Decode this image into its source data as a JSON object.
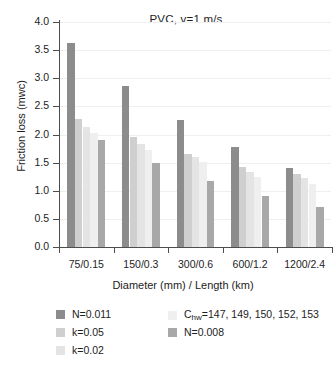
{
  "chart_data": {
    "type": "bar",
    "title": "PVC, v=1 m/s",
    "xlabel": "Diameter (mm) / Length (km)",
    "ylabel": "Friction loss (mwc)",
    "categories": [
      "75/0.15",
      "150/0.3",
      "300/0.6",
      "600/1.2",
      "1200/2.4"
    ],
    "ylim": [
      0.0,
      4.0
    ],
    "yticks": [
      "0.0",
      "0.5",
      "1.0",
      "1.5",
      "2.0",
      "2.5",
      "3.0",
      "3.5",
      "4.0"
    ],
    "grid": true,
    "legend_position": "bottom",
    "series": [
      {
        "name": "N=0.011",
        "color": "#8c8c8c",
        "values": [
          3.63,
          2.87,
          2.26,
          1.78,
          1.4
        ]
      },
      {
        "name": "k=0.05",
        "color": "#cfcfcf",
        "values": [
          2.28,
          1.95,
          1.66,
          1.42,
          1.3
        ]
      },
      {
        "name": "k=0.02",
        "color": "#e4e4e4",
        "values": [
          2.13,
          1.83,
          1.6,
          1.33,
          1.22
        ]
      },
      {
        "name": "Chw=147, 149, 150, 152, 153",
        "name_prefix": "C",
        "name_sub": "hw",
        "name_suffix": "=147, 149, 150, 152, 153",
        "color": "#efefef",
        "values": [
          2.03,
          1.73,
          1.52,
          1.25,
          1.12
        ]
      },
      {
        "name": "N=0.008",
        "color": "#a8a8a8",
        "values": [
          1.91,
          1.5,
          1.17,
          0.91,
          0.71
        ]
      }
    ]
  },
  "legend": {
    "entries": [
      {
        "label": "N=0.011",
        "color": "#8c8c8c"
      },
      {
        "label": "k=0.05",
        "color": "#cfcfcf"
      },
      {
        "label": "k=0.02",
        "color": "#e4e4e4"
      },
      {
        "label": "Chw=147, 149, 150, 152, 153",
        "color": "#efefef"
      },
      {
        "label": "N=0.008",
        "color": "#a8a8a8"
      }
    ]
  }
}
